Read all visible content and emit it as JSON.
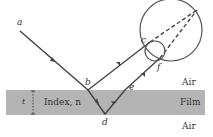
{
  "labels": {
    "a": "a",
    "b": "b",
    "c": "c",
    "d": "d",
    "e": "e",
    "f": "f",
    "thickness": "t",
    "index": "Index, n",
    "air_top": "Air",
    "film": "Film",
    "air_bottom": "Air"
  },
  "colors": {
    "film": "#b4b4b4",
    "line": "#444444",
    "background": "#ffffff"
  }
}
